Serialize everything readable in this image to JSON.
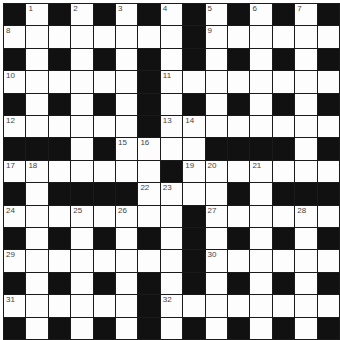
{
  "puzzle": {
    "rows": 15,
    "cols": 15,
    "grid": [
      "#.#.#.#.#.#.#.#",
      "........#......",
      "#.#.#.#.#.#.#.#",
      "......#........",
      "#.#.#.#.#.#.#.#",
      "......#........",
      "###.#....####.#",
      ".......#.......",
      "#.####....#.###",
      "........#......",
      "#.#.#.#.#.#.#.#",
      "........#......",
      "#.#.#.#.#.#.#.#",
      "......#........",
      "#.#.#.#.#.#.#.#"
    ],
    "numbers": [
      {
        "r": 0,
        "c": 1,
        "n": "1"
      },
      {
        "r": 0,
        "c": 3,
        "n": "2"
      },
      {
        "r": 0,
        "c": 5,
        "n": "3"
      },
      {
        "r": 0,
        "c": 7,
        "n": "4"
      },
      {
        "r": 0,
        "c": 9,
        "n": "5"
      },
      {
        "r": 0,
        "c": 11,
        "n": "6"
      },
      {
        "r": 0,
        "c": 13,
        "n": "7"
      },
      {
        "r": 1,
        "c": 0,
        "n": "8"
      },
      {
        "r": 1,
        "c": 9,
        "n": "9"
      },
      {
        "r": 3,
        "c": 0,
        "n": "10"
      },
      {
        "r": 3,
        "c": 7,
        "n": "11"
      },
      {
        "r": 5,
        "c": 0,
        "n": "12"
      },
      {
        "r": 5,
        "c": 7,
        "n": "13"
      },
      {
        "r": 5,
        "c": 8,
        "n": "14"
      },
      {
        "r": 6,
        "c": 5,
        "n": "15"
      },
      {
        "r": 6,
        "c": 6,
        "n": "16"
      },
      {
        "r": 7,
        "c": 0,
        "n": "17"
      },
      {
        "r": 7,
        "c": 1,
        "n": "18"
      },
      {
        "r": 7,
        "c": 8,
        "n": "19"
      },
      {
        "r": 7,
        "c": 9,
        "n": "20"
      },
      {
        "r": 7,
        "c": 11,
        "n": "21"
      },
      {
        "r": 8,
        "c": 6,
        "n": "22"
      },
      {
        "r": 8,
        "c": 7,
        "n": "23"
      },
      {
        "r": 9,
        "c": 0,
        "n": "24"
      },
      {
        "r": 9,
        "c": 3,
        "n": "25"
      },
      {
        "r": 9,
        "c": 5,
        "n": "26"
      },
      {
        "r": 9,
        "c": 9,
        "n": "27"
      },
      {
        "r": 9,
        "c": 13,
        "n": "28"
      },
      {
        "r": 11,
        "c": 0,
        "n": "29"
      },
      {
        "r": 11,
        "c": 9,
        "n": "30"
      },
      {
        "r": 13,
        "c": 0,
        "n": "31"
      },
      {
        "r": 13,
        "c": 7,
        "n": "32"
      }
    ]
  }
}
